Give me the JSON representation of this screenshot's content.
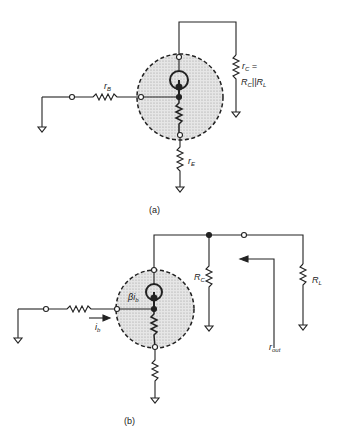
{
  "figure_a": {
    "caption": "(a)",
    "labels": {
      "rB": {
        "main": "r",
        "sub": "B"
      },
      "rE": {
        "main": "r",
        "sub": "E"
      },
      "rC_line1": {
        "main": "r",
        "sub": "C",
        "tail": " ="
      },
      "rC_line2": {
        "R1": "R",
        "s1": "C",
        "par": "||",
        "R2": "R",
        "s2": "L"
      }
    }
  },
  "figure_b": {
    "caption": "(b)",
    "labels": {
      "betaIb": {
        "main": "βi",
        "sub": "b"
      },
      "ib": {
        "main": "i",
        "sub": "b"
      },
      "RC": {
        "main": "R",
        "sub": "C"
      },
      "RL": {
        "main": "R",
        "sub": "L"
      },
      "rout": {
        "main": "r",
        "sub": "out"
      }
    }
  },
  "colors": {
    "line": "#222222",
    "fill": "#d9d9d9"
  }
}
